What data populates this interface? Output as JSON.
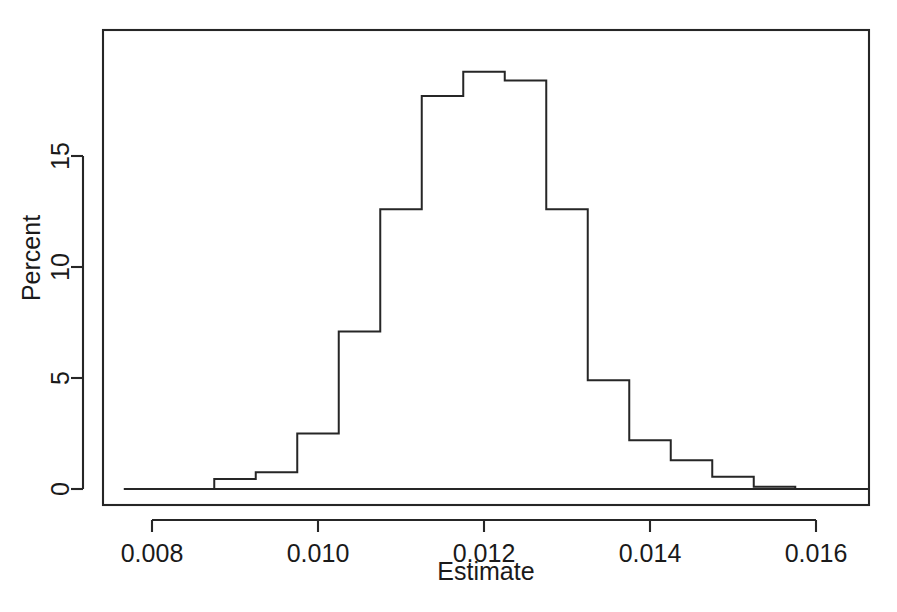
{
  "chart_data": {
    "type": "bar",
    "title": "",
    "subtitle": "",
    "xlabel": "Estimate",
    "ylabel": "Percent",
    "xlim": [
      0.00766,
      0.01688
    ],
    "ylim": [
      0,
      19.6
    ],
    "grid": false,
    "legend": null,
    "annotations": [],
    "x_ticks": [
      0.008,
      0.01,
      0.012,
      0.014,
      0.016
    ],
    "x_tick_labels": [
      "0.008",
      "0.010",
      "0.012",
      "0.014",
      "0.016"
    ],
    "y_ticks": [
      0,
      5,
      10,
      15
    ],
    "y_tick_labels": [
      "0",
      "5",
      "10",
      "15"
    ],
    "bin_width": 0.0005,
    "bin_edges": [
      0.00875,
      0.00925,
      0.00975,
      0.01025,
      0.01075,
      0.01125,
      0.01175,
      0.01225,
      0.01275,
      0.01325,
      0.01375,
      0.01425,
      0.01475,
      0.01525,
      0.01575
    ],
    "categories": [
      "0.00875-0.00925",
      "0.00925-0.00975",
      "0.00975-0.01025",
      "0.01025-0.01075",
      "0.01075-0.01125",
      "0.01125-0.01175",
      "0.01175-0.01225",
      "0.01225-0.01275",
      "0.01275-0.01325",
      "0.01325-0.01375",
      "0.01375-0.01425",
      "0.01425-0.01475",
      "0.01475-0.01525",
      "0.01525-0.01575"
    ],
    "values": [
      0.45,
      0.75,
      2.5,
      7.1,
      12.6,
      17.7,
      18.8,
      18.4,
      12.6,
      4.9,
      2.2,
      1.3,
      0.55,
      0.1
    ]
  },
  "figure": {
    "xlabel": "Estimate",
    "ylabel": "Percent",
    "background_color": "#ffffff",
    "line_color": "#262626"
  }
}
